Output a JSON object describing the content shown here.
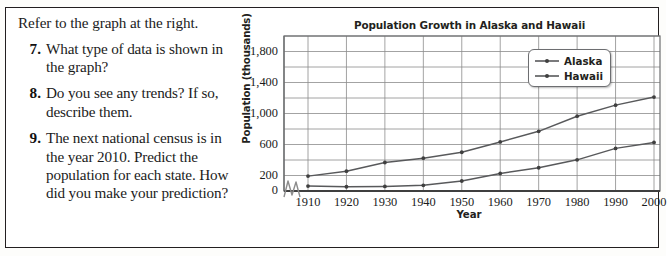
{
  "worksheet": {
    "intro": "Refer to the graph at the right.",
    "questions": [
      {
        "number": "7.",
        "text": "What type of data is shown in the graph?"
      },
      {
        "number": "8.",
        "text": "Do you see any trends? If so, describe them."
      },
      {
        "number": "9.",
        "text": "The next national census is in the year 2010. Predict the population for each state. How did you make your prediction?"
      }
    ]
  },
  "chart_data": {
    "type": "line",
    "title": "Population Growth in Alaska and Hawaii",
    "xlabel": "Year",
    "ylabel": "Population (thousands)",
    "x": [
      1910,
      1920,
      1930,
      1940,
      1950,
      1960,
      1970,
      1980,
      1990,
      2000
    ],
    "xtick_labels": [
      "1910",
      "1920",
      "1930",
      "1940",
      "1950",
      "1960",
      "1970",
      "1980",
      "1990",
      "2000"
    ],
    "ytick_labels": [
      "0",
      "200",
      "600",
      "1,000",
      "1,400",
      "1,800"
    ],
    "ytick_values": [
      0,
      200,
      600,
      1000,
      1400,
      1800
    ],
    "gridline_values": [
      0,
      200,
      400,
      600,
      800,
      1000,
      1200,
      1400,
      1600,
      1800,
      2000
    ],
    "ylim": [
      0,
      2000
    ],
    "xlim": [
      1905,
      2002
    ],
    "grid": true,
    "axis_break": true,
    "legend_position": "top-right",
    "series": [
      {
        "name": "Alaska",
        "color": "#58595b",
        "values": [
          64,
          55,
          59,
          73,
          129,
          226,
          300,
          402,
          550,
          627
        ]
      },
      {
        "name": "Hawaii",
        "color": "#58595b",
        "values": [
          192,
          256,
          368,
          423,
          500,
          633,
          770,
          965,
          1108,
          1212
        ]
      }
    ]
  },
  "colors": {
    "frame": "#231f20",
    "grid": "#8c8c8c",
    "axis": "#58595b",
    "line": "#6d6e71",
    "text": "#1b1b1b"
  }
}
